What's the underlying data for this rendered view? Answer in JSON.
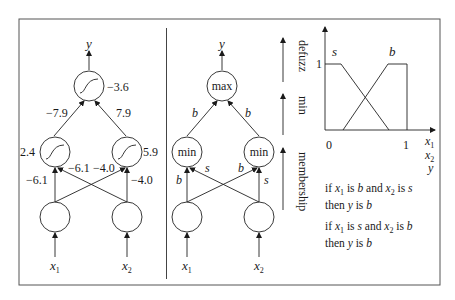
{
  "left_network": {
    "output_label": "y",
    "output_bias": "−3.6",
    "weights_top": [
      "−7.9",
      "7.9"
    ],
    "hidden_biases": [
      "2.4",
      "5.9"
    ],
    "weights_bottom_left": [
      "−6.1",
      "−6.1"
    ],
    "weights_bottom_right": [
      "−4.0",
      "−4.0"
    ],
    "inputs": [
      "x",
      "x"
    ],
    "input_subs": [
      "1",
      "2"
    ]
  },
  "fuzzy_network": {
    "output_label": "y",
    "top_node": "max",
    "hidden_nodes": [
      "min",
      "min"
    ],
    "edge_labels_top": [
      "b",
      "b"
    ],
    "edge_labels_bottom": [
      "b",
      "s",
      "b",
      "s"
    ],
    "inputs": [
      "x",
      "x"
    ],
    "input_subs": [
      "1",
      "2"
    ],
    "stage_labels": [
      "defuzz",
      "min",
      "membership"
    ]
  },
  "membership_chart": {
    "labels": [
      "s",
      "b"
    ],
    "y_tick": "1",
    "x_ticks": [
      "0",
      "1"
    ],
    "axis_labels": [
      "x",
      "x",
      "y"
    ],
    "axis_subs": [
      "1",
      "2",
      ""
    ]
  },
  "rules": [
    {
      "line1": [
        "if ",
        "x",
        "1",
        " is ",
        "b",
        " and ",
        "x",
        "2",
        " is ",
        "s"
      ],
      "line2": [
        "then ",
        "y",
        " is ",
        "b"
      ]
    },
    {
      "line1": [
        "if ",
        "x",
        "1",
        " is ",
        "s",
        " and ",
        "x",
        "2",
        " is ",
        "b"
      ],
      "line2": [
        "then ",
        "y",
        " is ",
        "b"
      ]
    }
  ]
}
